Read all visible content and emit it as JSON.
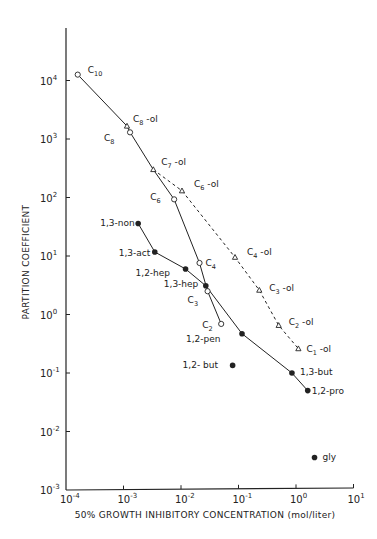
{
  "chart_data": {
    "type": "scatter",
    "title": "",
    "xlabel": "50% GROWTH INHIBITORY CONCENTRATION (mol/liter)",
    "ylabel": "PARTITION COEFFICIENT",
    "xscale": "log",
    "yscale": "log",
    "xlim": [
      0.0001,
      10
    ],
    "ylim": [
      0.001,
      50000
    ],
    "grid": false,
    "legend": null,
    "x_ticks": [
      {
        "base": "10",
        "exp": "-4",
        "value": 0.0001
      },
      {
        "base": "10",
        "exp": "-3",
        "value": 0.001
      },
      {
        "base": "10",
        "exp": "-2",
        "value": 0.01
      },
      {
        "base": "10",
        "exp": "-1",
        "value": 0.1
      },
      {
        "base": "10",
        "exp": "0",
        "value": 1
      },
      {
        "base": "10",
        "exp": "1",
        "value": 10
      }
    ],
    "y_ticks": [
      {
        "base": "10",
        "exp": "-3",
        "value": 0.001
      },
      {
        "base": "10",
        "exp": "-2",
        "value": 0.01
      },
      {
        "base": "10",
        "exp": "-1",
        "value": 0.1
      },
      {
        "base": "10",
        "exp": "0",
        "value": 1
      },
      {
        "base": "10",
        "exp": "1",
        "value": 10
      },
      {
        "base": "10",
        "exp": "2",
        "value": 100
      },
      {
        "base": "10",
        "exp": "3",
        "value": 1000
      },
      {
        "base": "10",
        "exp": "4",
        "value": 10000
      }
    ],
    "series": [
      {
        "name": "alkanes",
        "marker": "open-circle",
        "line": "solid",
        "points": [
          {
            "label": "C",
            "sub": "10",
            "suffix": "",
            "x": 0.00016,
            "y": 12600,
            "lx": 10,
            "ly": -2
          },
          {
            "label": "C",
            "sub": "8",
            "suffix": "",
            "x": 0.0013,
            "y": 1300,
            "lx": -26,
            "ly": 9
          },
          {
            "label": "C",
            "sub": "6",
            "suffix": "",
            "x": 0.0076,
            "y": 93,
            "lx": -24,
            "ly": 1
          },
          {
            "label": "C",
            "sub": "4",
            "suffix": "",
            "x": 0.021,
            "y": 7.6,
            "lx": 6,
            "ly": 3
          },
          {
            "label": "C",
            "sub": "3",
            "suffix": "",
            "x": 0.029,
            "y": 2.5,
            "lx": -20,
            "ly": 12
          },
          {
            "label": "C",
            "sub": "2",
            "suffix": "",
            "x": 0.05,
            "y": 0.69,
            "lx": -19,
            "ly": 4
          }
        ]
      },
      {
        "name": "alkanols",
        "marker": "open-triangle",
        "line": "dashed",
        "points": [
          {
            "label": "C",
            "sub": "8",
            "suffix": " -ol",
            "x": 0.00115,
            "y": 1660,
            "lx": 6,
            "ly": -4
          },
          {
            "label": "C",
            "sub": "7",
            "suffix": " -ol",
            "x": 0.0033,
            "y": 300,
            "lx": 8,
            "ly": -5
          },
          {
            "label": "C",
            "sub": "6",
            "suffix": " -ol",
            "x": 0.0104,
            "y": 130,
            "lx": 12,
            "ly": -4
          },
          {
            "label": "C",
            "sub": "4",
            "suffix": " -ol",
            "x": 0.087,
            "y": 9.5,
            "lx": 12,
            "ly": -2
          },
          {
            "label": "C",
            "sub": "3",
            "suffix": " -ol",
            "x": 0.23,
            "y": 2.6,
            "lx": 10,
            "ly": 1
          },
          {
            "label": "C",
            "sub": "2",
            "suffix": " -ol",
            "x": 0.5,
            "y": 0.65,
            "lx": 10,
            "ly": 0
          },
          {
            "label": "C",
            "sub": "1",
            "suffix": " -ol",
            "x": 1.1,
            "y": 0.26,
            "lx": 8,
            "ly": 3
          }
        ]
      },
      {
        "name": "diols",
        "marker": "filled-circle",
        "line": "solid",
        "points": [
          {
            "label": "1,3-non",
            "x": 0.0018,
            "y": 36,
            "lx": -38,
            "ly": 3
          },
          {
            "label": "1,3-act",
            "x": 0.0035,
            "y": 11.7,
            "lx": -36,
            "ly": 4
          },
          {
            "label": "1,2-hep",
            "x": 0.012,
            "y": 6.0,
            "lx": -50,
            "ly": 7
          },
          {
            "label": "1,3-hep",
            "x": 0.027,
            "y": 3.1,
            "lx": -42,
            "ly": 1
          },
          {
            "label": "1,2-pen",
            "x": 0.115,
            "y": 0.47,
            "lx": -56,
            "ly": 8
          },
          {
            "label": "1,3-but",
            "x": 0.85,
            "y": 0.1,
            "lx": 8,
            "ly": 2
          },
          {
            "label": "1,2-pro",
            "x": 1.6,
            "y": 0.05,
            "lx": 4,
            "ly": 3
          }
        ]
      },
      {
        "name": "unconnected",
        "marker": "filled-circle",
        "line": "none",
        "points": [
          {
            "label": "1,2- but",
            "x": 0.079,
            "y": 0.135,
            "lx": -50,
            "ly": 3
          },
          {
            "label": "gly",
            "x": 2.1,
            "y": 0.0036,
            "lx": 8,
            "ly": 3
          }
        ]
      }
    ],
    "connections": {
      "solid_main": [
        "alkanes:C10",
        "alkanols:C8-ol",
        "alkanes:C8",
        "alkanols:C7-ol",
        "alkanes:C6",
        "alkanes:C4",
        "alkanes:C3",
        "alkanes:C2"
      ],
      "dashed_ol": [
        "alkanols:C7-ol",
        "alkanols:C6-ol",
        "alkanols:C4-ol",
        "alkanols:C3-ol",
        "alkanols:C2-ol",
        "alkanols:C1-ol"
      ],
      "solid_diols": [
        "diols"
      ]
    }
  },
  "colors": {
    "ink": "#222222",
    "background": "#ffffff"
  }
}
